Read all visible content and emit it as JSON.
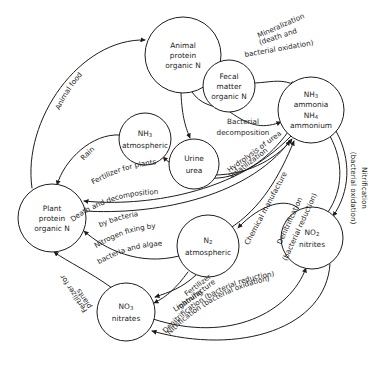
{
  "diagram": {
    "type": "cycle-diagram",
    "stroke_color": "#1d1d1d",
    "fill_color": "#ffffff",
    "background": "#ffffff"
  },
  "nodes": [
    {
      "id": "animal-protein",
      "name": "animal-protein-organic-n",
      "lines": [
        "Animal",
        "protein",
        "organic N"
      ],
      "cx": 183,
      "cy": 55,
      "r": 38
    },
    {
      "id": "fecal-matter",
      "name": "fecal-matter-organic-n",
      "lines": [
        "Fecal",
        "matter",
        "organic N"
      ],
      "cx": 229,
      "cy": 86,
      "r": 26
    },
    {
      "id": "ammonia",
      "name": "nh3-ammonia-nh4-ammonium",
      "lines": [
        "NH3",
        "ammonia",
        "NH4",
        "ammonium"
      ],
      "subscripts": {
        "NH3": [
          "NH",
          "3"
        ],
        "NH4": [
          "NH",
          "4"
        ]
      },
      "cx": 311,
      "cy": 110,
      "r": 33
    },
    {
      "id": "nh3-atmospheric",
      "name": "nh3-atmospheric",
      "lines": [
        "NH3",
        "atmospheric"
      ],
      "subscripts": {
        "NH3": [
          "NH",
          "3"
        ]
      },
      "cx": 145,
      "cy": 139,
      "r": 26
    },
    {
      "id": "urine-urea",
      "name": "urine-urea",
      "lines": [
        "Urine",
        "urea"
      ],
      "cx": 194,
      "cy": 164,
      "r": 25
    },
    {
      "id": "plant-protein",
      "name": "plant-protein-organic-n",
      "lines": [
        "Plant",
        "protein",
        "organic N"
      ],
      "cx": 52,
      "cy": 218,
      "r": 34
    },
    {
      "id": "n2-atmospheric",
      "name": "n2-atmospheric",
      "lines": [
        "N2",
        "atmospheric"
      ],
      "subscripts": {
        "N2": [
          "N",
          "2"
        ]
      },
      "cx": 208,
      "cy": 246,
      "r": 31
    },
    {
      "id": "no2-nitrites",
      "name": "no2-nitrites",
      "lines": [
        "NO2",
        "nitrites"
      ],
      "subscripts": {
        "NO2": [
          "NO",
          "2"
        ]
      },
      "cx": 312,
      "cy": 238,
      "r": 31
    },
    {
      "id": "no3-nitrates",
      "name": "no3-nitrates",
      "lines": [
        "NO3",
        "nitrates"
      ],
      "subscripts": {
        "NO3": [
          "NO",
          "3"
        ]
      },
      "cx": 126,
      "cy": 312,
      "r": 29
    }
  ],
  "edges": [
    {
      "name": "edge-plant-to-animal",
      "from": "plant-protein",
      "to": "animal-protein",
      "label": "Animal food"
    },
    {
      "name": "edge-animal-to-ammonia",
      "from": "animal-protein",
      "to": "ammonia",
      "label": "Mineralization (death and bacterial oxidation)"
    },
    {
      "name": "edge-animal-to-fecal",
      "from": "animal-protein",
      "to": "fecal-matter",
      "label": ""
    },
    {
      "name": "edge-fecal-to-ammonia",
      "from": "fecal-matter",
      "to": "ammonia",
      "label": "Bacterial decomposition"
    },
    {
      "name": "edge-animal-to-urine",
      "from": "animal-protein",
      "to": "urine-urea",
      "label": ""
    },
    {
      "name": "edge-urine-to-ammonia",
      "from": "urine-urea",
      "to": "ammonia",
      "label": "Hydrolysis of urea"
    },
    {
      "name": "edge-ammonia-to-nh3atm",
      "from": "ammonia",
      "to": "nh3-atmospheric",
      "label": "Volatilization"
    },
    {
      "name": "edge-nh3atm-to-plant",
      "from": "nh3-atmospheric",
      "to": "plant-protein",
      "label": "Rain"
    },
    {
      "name": "edge-ammonia-to-plant",
      "from": "ammonia",
      "to": "plant-protein",
      "label": "Fertilizer for plants"
    },
    {
      "name": "edge-plant-to-ammonia-death",
      "from": "plant-protein",
      "to": "ammonia",
      "label": "Death and decomposition by bacteria"
    },
    {
      "name": "edge-n2-to-plant",
      "from": "n2-atmospheric",
      "to": "plant-protein",
      "label": "Nitrogen fixing by bacteria and algae"
    },
    {
      "name": "edge-n2-to-ammonia",
      "from": "n2-atmospheric",
      "to": "ammonia",
      "label": "Chemical manufacture"
    },
    {
      "name": "edge-no2-to-n2",
      "from": "no2-nitrites",
      "to": "n2-atmospheric",
      "label": "Denitrification (bacterial reduction)"
    },
    {
      "name": "edge-ammonia-to-no2",
      "from": "ammonia",
      "to": "no2-nitrites",
      "label": "Nitrification (bacterial oxidation)"
    },
    {
      "name": "edge-n2-to-no3",
      "from": "n2-atmospheric",
      "to": "no3-nitrates",
      "label": "Fertilizer manufacture"
    },
    {
      "name": "edge-n2-to-no3-lightning",
      "from": "n2-atmospheric",
      "to": "no3-nitrates",
      "label": "Lightning"
    },
    {
      "name": "edge-no3-to-plant",
      "from": "no3-nitrates",
      "to": "plant-protein",
      "label": "Fertilizer for plants"
    },
    {
      "name": "edge-no3-to-no2-denit",
      "from": "no3-nitrates",
      "to": "no2-nitrites",
      "label": "Denitrification (bacterial reduction)"
    },
    {
      "name": "edge-no2-to-no3-nitrif",
      "from": "no2-nitrites",
      "to": "no3-nitrates",
      "label": "Nitrification (bacterial oxidation)"
    }
  ],
  "labels": {
    "animal_food": "Animal food",
    "mineralization_1": "Mineralization",
    "mineralization_2": "(death and",
    "mineralization_3": "bacterial oxidation)",
    "bacterial_decomposition_1": "Bacterial",
    "bacterial_decomposition_2": "decomposition",
    "hydrolysis_of_urea": "Hydrolysis of urea",
    "volatilization": "Volatilization",
    "rain": "Rain",
    "fertilizer_for_plants_top": "Fertilizer for plants",
    "death_decomposition_1": "Death and decomposition",
    "death_decomposition_2": "by bacteria",
    "nitrogen_fixing_1": "Nitrogen fixing by",
    "nitrogen_fixing_2": "bacteria and algae",
    "chemical_manufacture": "Chemical manufacture",
    "denitrification_1": "Denitrification",
    "denitrification_2": "(bacterial reduction)",
    "nitrification_right_1": "Nitrification",
    "nitrification_right_2": "(bacterial oxidation)",
    "fertilizer_manufacture_1": "Fertilizer",
    "fertilizer_manufacture_2": "manufacture",
    "lightning": "Lightning",
    "fertilizer_for_plants_left_1": "Fertilizer for",
    "fertilizer_for_plants_left_2": "plants",
    "denitrification_bottom": "Denitrification (bacterial reduction)",
    "nitrification_bottom": "Nitrification (bacterial oxidation)"
  }
}
